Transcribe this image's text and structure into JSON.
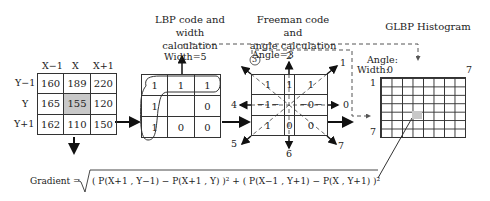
{
  "pixel_block": {
    "col_headers": [
      "X−1",
      "X",
      "X+1"
    ],
    "row_headers": [
      "Y−1",
      "Y",
      "Y+1"
    ],
    "values": [
      [
        "160",
        "189",
        "220"
      ],
      [
        "165",
        "155",
        "120"
      ],
      [
        "162",
        "110",
        "150"
      ]
    ],
    "highlight": {
      "row": 1,
      "col": 1,
      "color": "#c8c8c8"
    }
  },
  "lbp": {
    "title_line1": "LBP code and width",
    "title_line2": "calculation",
    "width_label": "Width=5",
    "values": [
      [
        "1",
        "1",
        "1"
      ],
      [
        "1",
        "",
        "0"
      ],
      [
        "1",
        "0",
        "0"
      ]
    ]
  },
  "freeman": {
    "title_line1": "Freeman code and",
    "title_line2": "angle calculation",
    "angle_label": "Angle=3",
    "circled": "3",
    "values": [
      [
        "1",
        "1",
        "1"
      ],
      [
        "−1−",
        "",
        "−0−"
      ],
      [
        "1",
        "0",
        "0"
      ]
    ],
    "directions": [
      "0",
      "1",
      "2",
      "3",
      "4",
      "5",
      "6",
      "7"
    ]
  },
  "histogram": {
    "title": "GLBP Histogram",
    "angle_label": "Angle:",
    "width_label": "Width:",
    "x_start": "0",
    "x_end": "7",
    "y_start": "1",
    "y_end": "7",
    "rows": 7,
    "cols": 8,
    "highlight": {
      "row": 4,
      "col": 3,
      "color": "#c8c8c8"
    }
  },
  "formula": {
    "lhs": "Gradient =",
    "rhs": "( P(X+1 , Y−1) − P(X+1 , Y) )² +  ( P(X−1 , Y+1) − P(X , Y+1) )²"
  }
}
